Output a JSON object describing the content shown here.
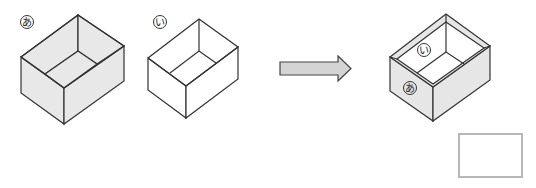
{
  "figure": {
    "box_a": {
      "label": "あ",
      "shading": "gray",
      "fill": "#e6e6e6"
    },
    "box_b": {
      "label": "い",
      "shading": "white",
      "fill": "#ffffff"
    },
    "arrow": {
      "direction": "right",
      "fill": "#d4d4d4"
    },
    "result_box": {
      "outer_label": "あ",
      "inner_label": "い",
      "outer_fill": "#e6e6e6",
      "inner_fill": "#ffffff"
    },
    "answer_box": {
      "content": ""
    },
    "colors": {
      "stroke": "#333333",
      "gray": "#e6e6e6",
      "answer_border": "#b8b8b8"
    }
  }
}
